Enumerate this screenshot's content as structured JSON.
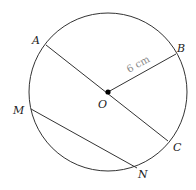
{
  "diagram": {
    "type": "circle-geometry",
    "circle": {
      "center": "O",
      "cx": 108,
      "cy": 92,
      "r": 79
    },
    "points": {
      "O": {
        "label": "O",
        "x": 108,
        "y": 92
      },
      "A": {
        "label": "A",
        "x": 46,
        "y": 45
      },
      "B": {
        "label": "B",
        "x": 176,
        "y": 54
      },
      "C": {
        "label": "C",
        "x": 168,
        "y": 141
      },
      "M": {
        "label": "M",
        "x": 31,
        "y": 109
      },
      "N": {
        "label": "N",
        "x": 137,
        "y": 168
      }
    },
    "segments": [
      {
        "name": "diameter-AC",
        "from": "A",
        "to": "C"
      },
      {
        "name": "radius-OB",
        "from": "O",
        "to": "B"
      },
      {
        "name": "chord-MN",
        "from": "M",
        "to": "N"
      }
    ],
    "measurement": {
      "label": "6 cm",
      "segment": "OB"
    },
    "colors": {
      "stroke": "#333333",
      "measure_text": "#888888",
      "center_dot": "#000000"
    }
  }
}
